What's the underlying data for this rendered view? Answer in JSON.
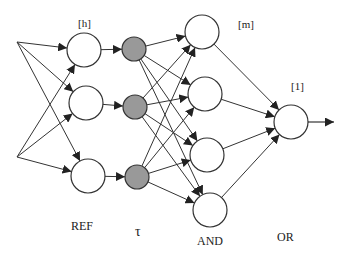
{
  "diagram": {
    "type": "layered-network",
    "colors": {
      "stroke": "#333333",
      "hidden_fill": "#ffffff",
      "tau_fill": "#999999"
    },
    "layers": [
      {
        "id": "input",
        "label": "",
        "nodes": [
          {
            "x": 17,
            "y": 42
          },
          {
            "x": 17,
            "y": 157
          }
        ]
      },
      {
        "id": "ref",
        "label": "REF",
        "size_label": "[h]",
        "nodes": [
          {
            "x": 84,
            "y": 50
          },
          {
            "x": 86,
            "y": 103
          },
          {
            "x": 88,
            "y": 176
          }
        ],
        "r": 17,
        "fill": "#ffffff"
      },
      {
        "id": "tau",
        "label": "τ",
        "nodes": [
          {
            "x": 134,
            "y": 49
          },
          {
            "x": 135,
            "y": 107
          },
          {
            "x": 137,
            "y": 177
          }
        ],
        "r": 12,
        "fill": "#999999"
      },
      {
        "id": "and",
        "label": "AND",
        "size_label": "[m]",
        "nodes": [
          {
            "x": 202,
            "y": 32
          },
          {
            "x": 205,
            "y": 94
          },
          {
            "x": 207,
            "y": 155
          },
          {
            "x": 210,
            "y": 210
          }
        ],
        "r": 17,
        "fill": "#ffffff"
      },
      {
        "id": "or",
        "label": "OR",
        "size_label": "[1]",
        "nodes": [
          {
            "x": 291,
            "y": 122
          }
        ],
        "r": 17,
        "fill": "#ffffff"
      }
    ],
    "edges": [
      [
        "input",
        0,
        "ref",
        0
      ],
      [
        "input",
        0,
        "ref",
        1
      ],
      [
        "input",
        0,
        "ref",
        2
      ],
      [
        "input",
        1,
        "ref",
        0
      ],
      [
        "input",
        1,
        "ref",
        1
      ],
      [
        "input",
        1,
        "ref",
        2
      ],
      [
        "ref",
        0,
        "tau",
        0
      ],
      [
        "ref",
        1,
        "tau",
        1
      ],
      [
        "ref",
        2,
        "tau",
        2
      ],
      [
        "tau",
        0,
        "and",
        0
      ],
      [
        "tau",
        0,
        "and",
        1
      ],
      [
        "tau",
        0,
        "and",
        2
      ],
      [
        "tau",
        0,
        "and",
        3
      ],
      [
        "tau",
        1,
        "and",
        0
      ],
      [
        "tau",
        1,
        "and",
        1
      ],
      [
        "tau",
        1,
        "and",
        2
      ],
      [
        "tau",
        1,
        "and",
        3
      ],
      [
        "tau",
        2,
        "and",
        0
      ],
      [
        "tau",
        2,
        "and",
        1
      ],
      [
        "tau",
        2,
        "and",
        2
      ],
      [
        "tau",
        2,
        "and",
        3
      ],
      [
        "and",
        0,
        "or",
        0
      ],
      [
        "and",
        1,
        "or",
        0
      ],
      [
        "and",
        2,
        "or",
        0
      ],
      [
        "and",
        3,
        "or",
        0
      ]
    ],
    "output": {
      "from": {
        "x": 308,
        "y": 122
      },
      "to": {
        "x": 334,
        "y": 122
      }
    },
    "labels": {
      "h": "[h]",
      "m": "[m]",
      "one": "[1]",
      "ref": "REF",
      "tau": "τ",
      "and": "AND",
      "or": "OR"
    }
  }
}
